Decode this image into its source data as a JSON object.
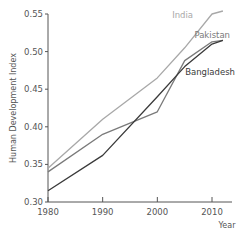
{
  "chart_data": {
    "type": "line",
    "title": "",
    "xlabel": "Year",
    "ylabel": "Human Development Index",
    "xlim": [
      1980,
      2012
    ],
    "ylim": [
      0.3,
      0.55
    ],
    "x_ticks": [
      "1980",
      "1990",
      "2000",
      "2010"
    ],
    "y_ticks": [
      "0.30",
      "0.35",
      "0.40",
      "0.45",
      "0.50",
      "0.55"
    ],
    "grid": false,
    "legend_position": "inline-labels",
    "series": [
      {
        "name": "India",
        "color": "#a8a8a8",
        "x": [
          1980,
          1990,
          2000,
          2005,
          2010,
          2012
        ],
        "values": [
          0.345,
          0.41,
          0.465,
          0.505,
          0.55,
          0.554
        ]
      },
      {
        "name": "Pakistan",
        "color": "#7a7a7a",
        "x": [
          1980,
          1990,
          2000,
          2005,
          2010,
          2012
        ],
        "values": [
          0.34,
          0.39,
          0.42,
          0.488,
          0.513,
          0.515
        ]
      },
      {
        "name": "Bangladesh",
        "color": "#3a3a3a",
        "x": [
          1980,
          1990,
          2000,
          2005,
          2010,
          2012
        ],
        "values": [
          0.315,
          0.362,
          0.44,
          0.48,
          0.51,
          0.515
        ]
      }
    ]
  }
}
